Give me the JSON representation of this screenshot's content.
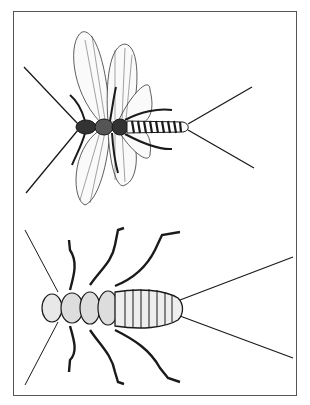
{
  "illustration": {
    "subject": "stonefly adult and nymph",
    "panels": [
      {
        "label": "adult-stonefly-winged"
      },
      {
        "label": "stonefly-nymph"
      }
    ],
    "colors": {
      "ink": "#1a1a1a",
      "border": "#555555",
      "background": "#ffffff"
    }
  }
}
